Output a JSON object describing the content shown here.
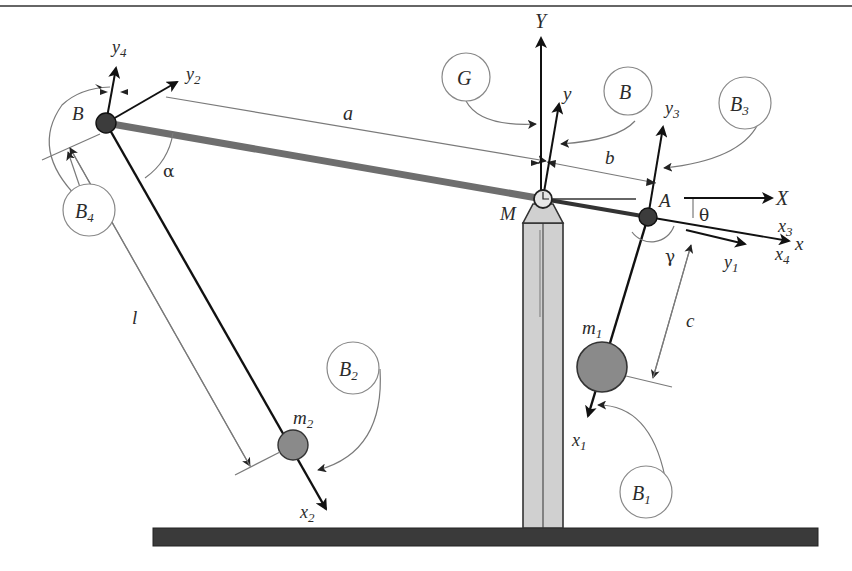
{
  "diagram": {
    "type": "mechanical-schematic",
    "colors": {
      "beam": "#6e6e6e",
      "links": "#111111",
      "masses": "#8a8a8a",
      "pillar": "#d0d0d0",
      "ground": "#3a3a3a",
      "annotation": "#888888"
    },
    "points": {
      "B": "B",
      "M": "M",
      "A": "A"
    },
    "masses": {
      "m1": {
        "base": "m",
        "sub": "1"
      },
      "m2": {
        "base": "m",
        "sub": "2"
      }
    },
    "lengths": {
      "a": "a",
      "b": "b",
      "c": "c",
      "l": "l"
    },
    "angles": {
      "alpha": "α",
      "gamma": "γ",
      "theta": "θ"
    },
    "axes": {
      "X": "X",
      "Y": "Y",
      "x": "x",
      "y": "y",
      "x1": {
        "base": "x",
        "sub": "1"
      },
      "y1": {
        "base": "y",
        "sub": "1"
      },
      "x2": {
        "base": "x",
        "sub": "2"
      },
      "y2": {
        "base": "y",
        "sub": "2"
      },
      "x3": {
        "base": "x",
        "sub": "3"
      },
      "y3": {
        "base": "y",
        "sub": "3"
      },
      "x4": {
        "base": "x",
        "sub": "4"
      },
      "y4": {
        "base": "y",
        "sub": "4"
      }
    },
    "frames": {
      "G": {
        "base": "G",
        "sub": ""
      },
      "B": {
        "base": "B",
        "sub": ""
      },
      "B1": {
        "base": "B",
        "sub": "1"
      },
      "B2": {
        "base": "B",
        "sub": "2"
      },
      "B3": {
        "base": "B",
        "sub": "3"
      },
      "B4": {
        "base": "B",
        "sub": "4"
      }
    }
  }
}
